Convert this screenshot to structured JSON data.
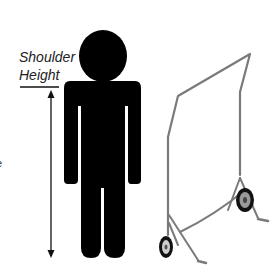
{
  "diagram": {
    "label": {
      "line1": "Shoulder",
      "line2": "Height"
    },
    "edge_text": "e",
    "elements": {
      "person": "black pictogram of a standing person",
      "measurement_arrow": "double-headed vertical arrow indicating shoulder height",
      "rack": "rolling garment rack with two wheels"
    },
    "colors": {
      "person": "#000000",
      "rack": "#7a7a7a",
      "text": "#222222"
    }
  }
}
